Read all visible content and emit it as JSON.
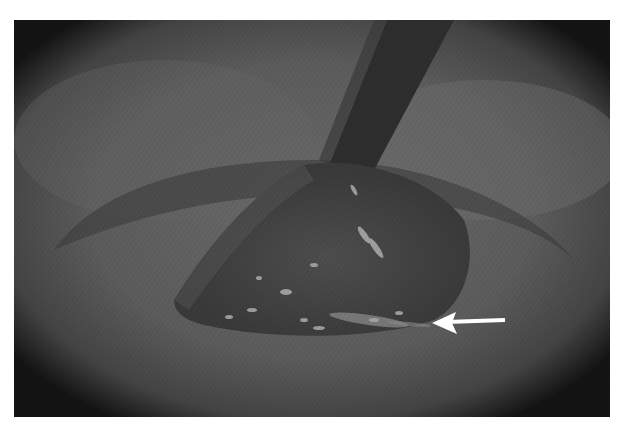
{
  "figure": {
    "kind": "grayscale endoscopic photograph",
    "annotation": {
      "type": "arrow",
      "color": "#ffffff",
      "direction": "left",
      "tip": [
        432,
        323
      ],
      "tail": [
        506,
        320
      ]
    },
    "colors": {
      "background": "#ffffff",
      "tissue": "#5e5e5e",
      "dark_edge": "#1a1a1a",
      "instrument": "#2e2e2e",
      "highlight": "#bdbdbd"
    }
  }
}
